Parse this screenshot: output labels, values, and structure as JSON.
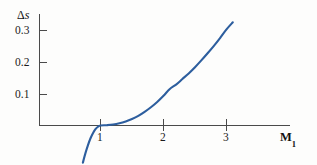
{
  "figure": {
    "background_color": "#fdfdfc",
    "axis_color": "#4a4a4a"
  },
  "chart_data": {
    "type": "line",
    "title": "",
    "subtitle": "",
    "xlabel": "M",
    "xlabel_subscript": "1",
    "xlabel_full": "M₁",
    "ylabel": "Δs",
    "ylabel_symbol": "Δ",
    "ylabel_variable": "s",
    "series": [
      {
        "name": "Entropy change across a normal shock",
        "color": "#2d5e9e",
        "x": [
          0.72,
          0.76,
          0.8,
          0.84,
          0.88,
          0.92,
          0.96,
          1.0,
          1.1,
          1.2,
          1.3,
          1.4,
          1.5,
          1.6,
          1.7,
          1.8,
          1.9,
          2.0,
          2.1,
          2.2,
          2.3,
          2.4,
          2.5,
          2.6,
          2.7,
          2.8,
          2.9,
          3.0,
          3.1
        ],
        "y": [
          -0.12,
          -0.09,
          -0.064,
          -0.042,
          -0.025,
          -0.012,
          -0.004,
          0.0,
          0.001,
          0.003,
          0.007,
          0.013,
          0.021,
          0.031,
          0.044,
          0.059,
          0.076,
          0.096,
          0.118,
          0.132,
          0.15,
          0.168,
          0.188,
          0.21,
          0.233,
          0.257,
          0.283,
          0.31,
          0.333
        ]
      }
    ],
    "x_ticks": [
      1,
      2,
      3
    ],
    "x_tick_labels": [
      "1",
      "2",
      "3"
    ],
    "y_ticks": [
      0.1,
      0.2,
      0.3
    ],
    "y_tick_labels": [
      "0.1",
      "0.2",
      "0.3"
    ],
    "xlim": [
      0.4,
      4.0
    ],
    "ylim": [
      -0.13,
      0.36
    ],
    "grid": false,
    "legend": false,
    "legend_position": "none",
    "annotations": []
  },
  "axis_labels": {
    "y_axis": {
      "delta": "Δ",
      "variable": "s"
    },
    "x_axis": {
      "symbol": "M",
      "subscript": "1"
    }
  },
  "y_tick_values": {
    "t3": "0.3",
    "t2": "0.2",
    "t1": "0.1"
  },
  "x_tick_values": {
    "t1": "1",
    "t2": "2",
    "t3": "3"
  }
}
